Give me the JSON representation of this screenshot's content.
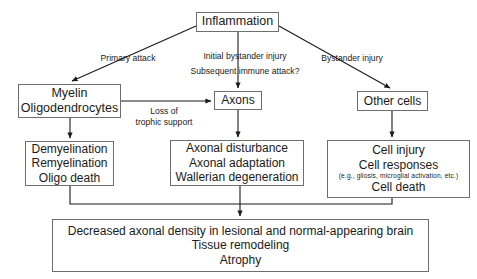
{
  "diagram": {
    "background_color": "#ffffff",
    "box_border_color": "#6e6e6e",
    "connector_color": "#1a1a1a",
    "nodes": {
      "inflammation": {
        "label": "Inflammation"
      },
      "myelin": {
        "line1": "Myelin",
        "line2": "Oligodendrocytes"
      },
      "axons": {
        "label": "Axons"
      },
      "other_cells": {
        "label": "Other cells"
      },
      "demyelination": {
        "line1": "Demyelination",
        "line2": "Remyelination",
        "line3": "Oligo death"
      },
      "axonal": {
        "line1": "Axonal disturbance",
        "line2": "Axonal adaptation",
        "line3": "Wallerian degeneration"
      },
      "cell_injury": {
        "line1": "Cell injury",
        "line2": "Cell responses",
        "note": "(e.g., gliosis, microglial activation, etc.)",
        "line3": "Cell death"
      },
      "outcome": {
        "line1": "Decreased axonal density in lesional and normal-appearing brain",
        "line2": "Tissue remodeling",
        "line3": "Atrophy"
      }
    },
    "edge_labels": {
      "primary_attack": "Primary attack",
      "initial_bystander": "Initial bystander injury",
      "subsequent_immune": "Subsequent immune attack?",
      "bystander_injury": "Bystander injury",
      "loss_of": "Loss of",
      "trophic_support": "trophic support"
    }
  }
}
